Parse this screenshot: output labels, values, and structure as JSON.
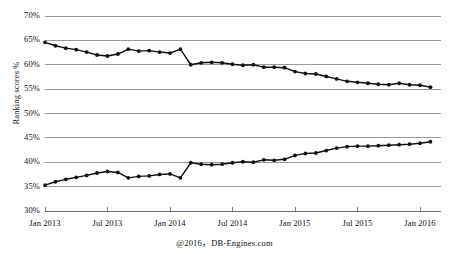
{
  "chart_data": {
    "type": "line",
    "title": "",
    "subtitle": "",
    "xlabel": "",
    "ylabel": "Ranking scores %",
    "ylim": [
      30,
      70
    ],
    "y_ticks": [
      30,
      35,
      40,
      45,
      50,
      55,
      60,
      65,
      70
    ],
    "y_tick_labels": [
      "30%",
      "35%",
      "40%",
      "45%",
      "50%",
      "55%",
      "60%",
      "65%",
      "70%"
    ],
    "grid": true,
    "legend": "none",
    "annotation": "@2016，DB-Engines.com",
    "x_tick_labels": [
      "Jan 2013",
      "Jul 2013",
      "Jan 2014",
      "Jul 2014",
      "Jan 2015",
      "Jul 2015",
      "Jan 2016"
    ],
    "x_tick_values": [
      "2013-01",
      "2013-07",
      "2014-01",
      "2014-07",
      "2015-01",
      "2015-07",
      "2016-01"
    ],
    "x": [
      "2013-01",
      "2013-02",
      "2013-03",
      "2013-04",
      "2013-05",
      "2013-06",
      "2013-07",
      "2013-08",
      "2013-09",
      "2013-10",
      "2013-11",
      "2013-12",
      "2014-01",
      "2014-02",
      "2014-03",
      "2014-04",
      "2014-05",
      "2014-06",
      "2014-07",
      "2014-08",
      "2014-09",
      "2014-10",
      "2014-11",
      "2014-12",
      "2015-01",
      "2015-02",
      "2015-03",
      "2015-04",
      "2015-05",
      "2015-06",
      "2015-07",
      "2015-08",
      "2015-09",
      "2015-10",
      "2015-11",
      "2015-12",
      "2016-01",
      "2016-02"
    ],
    "series": [
      {
        "name": "Relational DBMS share (upper)",
        "color": "#111111",
        "values": [
          64.6,
          63.9,
          63.4,
          63.1,
          62.6,
          62.0,
          61.8,
          62.2,
          63.2,
          62.8,
          62.9,
          62.6,
          62.4,
          63.2,
          60.0,
          60.4,
          60.5,
          60.4,
          60.1,
          59.9,
          60.0,
          59.5,
          59.5,
          59.4,
          58.6,
          58.2,
          58.1,
          57.6,
          57.1,
          56.6,
          56.4,
          56.2,
          56.0,
          55.9,
          56.2,
          55.9,
          55.8,
          55.4
        ]
      },
      {
        "name": "Other DBMS share (lower)",
        "color": "#111111",
        "values": [
          35.3,
          36.0,
          36.5,
          36.9,
          37.3,
          37.8,
          38.1,
          37.9,
          36.8,
          37.1,
          37.2,
          37.5,
          37.6,
          36.8,
          39.9,
          39.6,
          39.5,
          39.6,
          39.9,
          40.1,
          40.0,
          40.5,
          40.4,
          40.6,
          41.4,
          41.8,
          41.9,
          42.4,
          42.9,
          43.2,
          43.3,
          43.3,
          43.4,
          43.5,
          43.6,
          43.7,
          43.9,
          44.2
        ]
      }
    ]
  },
  "axis": {
    "y_title": "Ranking scores %"
  },
  "footer": {
    "credit": "@2016，DB-Engines.com"
  }
}
